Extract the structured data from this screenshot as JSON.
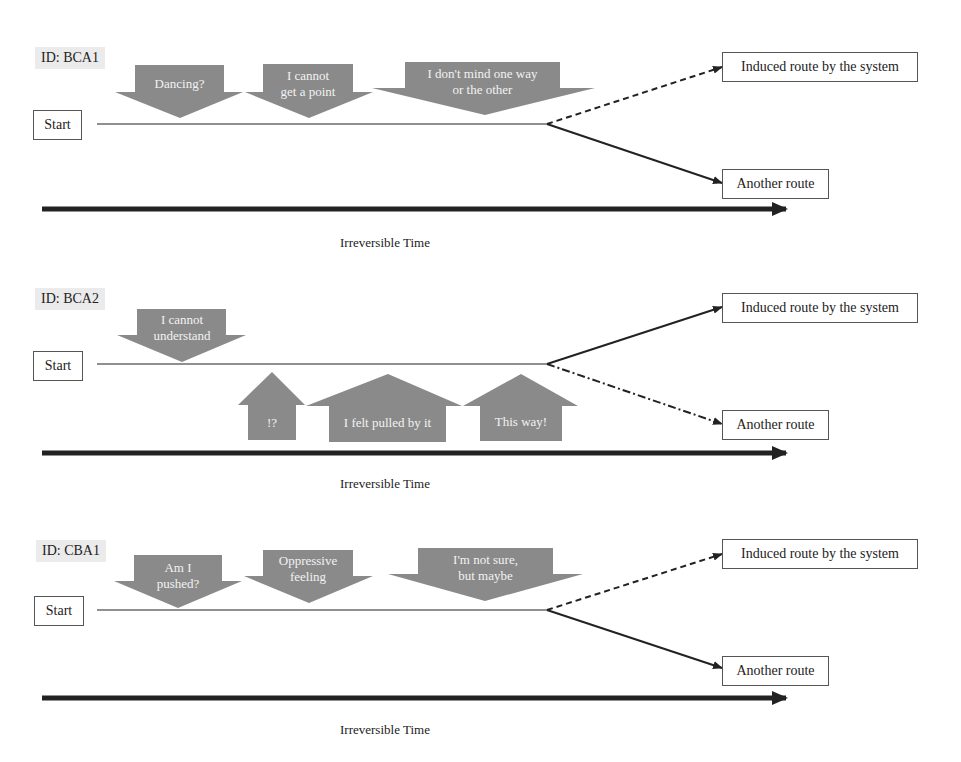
{
  "colors": {
    "arrow_fill": "#8a8a8a",
    "line": "#222222",
    "id_bg": "#ebebeb"
  },
  "panels": [
    {
      "id": "ID: BCA1",
      "start": "Start",
      "induced": "Induced route by the system",
      "another": "Another route",
      "time": "Irreversible Time",
      "induced_line_style": "dashed",
      "another_line_style": "solid",
      "callouts": [
        {
          "direction": "down",
          "text1": "Dancing?",
          "text2": ""
        },
        {
          "direction": "down",
          "text1": "I cannot",
          "text2": "get a point"
        },
        {
          "direction": "down",
          "text1": "I don't mind one way",
          "text2": "or the other"
        }
      ]
    },
    {
      "id": "ID: BCA2",
      "start": "Start",
      "induced": "Induced route by the system",
      "another": "Another route",
      "time": "Irreversible Time",
      "induced_line_style": "solid",
      "another_line_style": "dash-dot",
      "callouts": [
        {
          "direction": "down",
          "text1": "I cannot",
          "text2": "understand"
        },
        {
          "direction": "up",
          "text1": "!?",
          "text2": ""
        },
        {
          "direction": "up",
          "text1": "I felt  pulled by it",
          "text2": ""
        },
        {
          "direction": "up",
          "text1": "This way!",
          "text2": ""
        }
      ]
    },
    {
      "id": "ID: CBA1",
      "start": "Start",
      "induced": "Induced route by the system",
      "another": "Another route",
      "time": "Irreversible Time",
      "induced_line_style": "dashed",
      "another_line_style": "solid",
      "callouts": [
        {
          "direction": "down",
          "text1": "Am I",
          "text2": "pushed?"
        },
        {
          "direction": "down",
          "text1": "Oppressive",
          "text2": "feeling"
        },
        {
          "direction": "down",
          "text1": "I'm not sure,",
          "text2": "but maybe"
        }
      ]
    }
  ]
}
